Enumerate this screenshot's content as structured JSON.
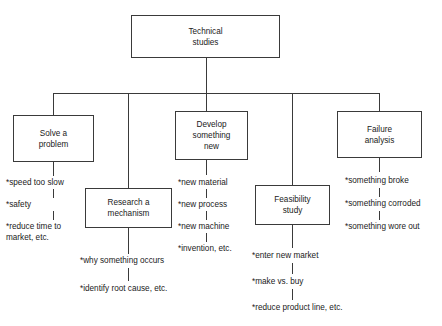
{
  "diagram": {
    "title_box": {
      "label": "Technical\nstudies"
    },
    "branches": [
      {
        "key": "solve-a-problem",
        "label": "Solve a\nproblem",
        "bullets": [
          "*speed too slow",
          "*safety",
          "*reduce time to\n  market, etc."
        ]
      },
      {
        "key": "research-a-mechanism",
        "label": "Research a\nmechanism",
        "bullets": [
          "*why something occurs",
          "*identify root cause, etc."
        ]
      },
      {
        "key": "develop-something-new",
        "label": "Develop\nsomething\nnew",
        "bullets": [
          "*new material",
          "*new process",
          "*new machine",
          "*invention, etc."
        ]
      },
      {
        "key": "feasibility-study",
        "label": "Feasibility\nstudy",
        "bullets": [
          "*enter new market",
          "*make vs. buy",
          "*reduce product line, etc."
        ]
      },
      {
        "key": "failure-analysis",
        "label": "Failure\nanalysis",
        "bullets": [
          "*something broke",
          "*something corroded",
          "*something wore out"
        ]
      }
    ],
    "colors": {
      "line": "#3a3a3a",
      "text": "#1a1a1a",
      "background": "#ffffff"
    }
  }
}
